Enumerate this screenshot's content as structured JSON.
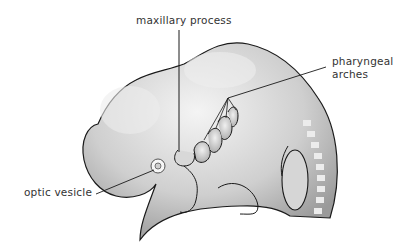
{
  "diagram": {
    "labels": {
      "maxillary_process": "maxillary process",
      "pharyngeal_arches_line1": "pharyngeal",
      "pharyngeal_arches_line2": "arches",
      "optic_vesicle": "optic vesicle"
    },
    "colors": {
      "body_fill": "#c8c8c8",
      "highlight": "#f2f2f2",
      "outline": "#1a1a1a",
      "somite": "#e6e6e6",
      "label_text": "#333333"
    }
  }
}
